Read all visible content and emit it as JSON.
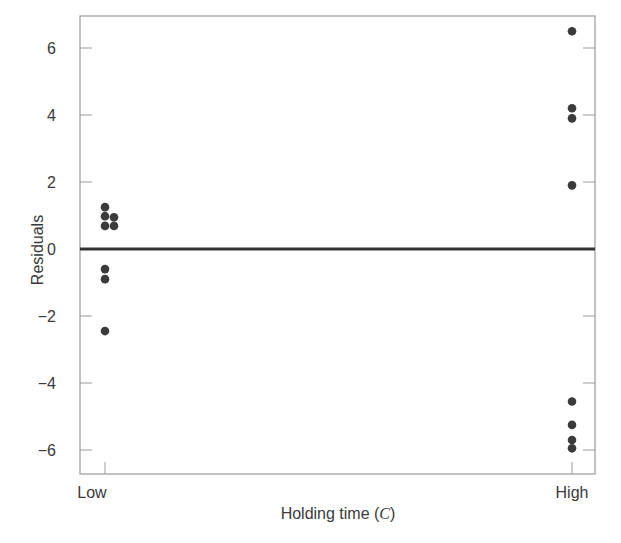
{
  "chart_data": {
    "type": "scatter",
    "title": "",
    "xlabel": "Holding time (C)",
    "xlabel_parts": {
      "prefix": "Holding time (",
      "italic": "C",
      "suffix": ")"
    },
    "ylabel": "Residuals",
    "categories": [
      "Low",
      "High"
    ],
    "ylim": [
      -6.8,
      6.9
    ],
    "yticks": [
      6,
      4,
      2,
      0,
      -2,
      -4,
      -6
    ],
    "ytick_labels": [
      "6",
      "4",
      "2",
      "0",
      "−2",
      "−4",
      "−6"
    ],
    "grid": false,
    "legend": null,
    "reference_line": {
      "y": 0,
      "color": "#333333"
    },
    "series": [
      {
        "name": "Low",
        "x": "Low",
        "points": [
          {
            "y": 1.25,
            "offset": 0
          },
          {
            "y": 0.98,
            "offset": 0
          },
          {
            "y": 0.69,
            "offset": 0
          },
          {
            "y": 0.95,
            "offset": 1
          },
          {
            "y": 0.69,
            "offset": 1
          },
          {
            "y": -0.6,
            "offset": 0
          },
          {
            "y": -0.9,
            "offset": 0
          },
          {
            "y": -2.45,
            "offset": 0
          }
        ]
      },
      {
        "name": "High",
        "x": "High",
        "points": [
          {
            "y": 6.5,
            "offset": 0
          },
          {
            "y": 4.2,
            "offset": 0
          },
          {
            "y": 3.9,
            "offset": 0
          },
          {
            "y": 1.9,
            "offset": 0
          },
          {
            "y": -4.55,
            "offset": 0
          },
          {
            "y": -5.25,
            "offset": 0
          },
          {
            "y": -5.7,
            "offset": 0
          },
          {
            "y": -5.95,
            "offset": 0
          }
        ]
      }
    ],
    "colors": {
      "point": "#3b3b3b",
      "axis": "#9a9a9a",
      "zero_line": "#333333"
    }
  }
}
